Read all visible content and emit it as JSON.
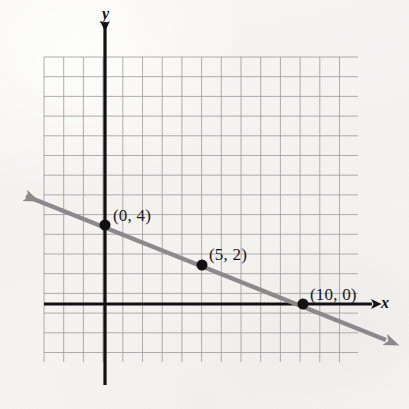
{
  "figure": {
    "kind": "coordinate-plane-line-graph",
    "width": 409,
    "height": 409,
    "background_color": "#f5f4f2"
  },
  "axes": {
    "x_label": "x",
    "y_label": "y",
    "axis_color": "#111113",
    "origin_px": {
      "x": 105,
      "y": 304
    },
    "unit_px": 19.8,
    "x_axis_px": {
      "start_x": 44,
      "end_x": 372,
      "y": 304
    },
    "y_axis_px": {
      "x": 105,
      "start_y": 22,
      "end_y": 385
    }
  },
  "grid": {
    "visible": true,
    "color": "#9a9a9c",
    "cell_px": 19.7,
    "left_px": 44,
    "top_px": 57,
    "right_px": 358,
    "bottom_px": 362,
    "columns": 16,
    "rows": 15
  },
  "line": {
    "color": "#8a8a8c",
    "width_px": 4.5,
    "double_arrow": true,
    "arrow_start_px": {
      "x": 26,
      "y": 196
    },
    "arrow_end_px": {
      "x": 386,
      "y": 340
    }
  },
  "chart_data": {
    "type": "line",
    "title": "",
    "xlabel": "x",
    "ylabel": "y",
    "grid": true,
    "legend": "none",
    "xlim": [
      -3,
      13
    ],
    "ylim": [
      -3,
      13
    ],
    "series": [
      {
        "name": "line",
        "equation": "y = -0.4x + 4",
        "slope": -0.4,
        "intercept": 4,
        "x": [
          -4,
          14.2
        ],
        "values": [
          5.6,
          -1.68
        ],
        "color": "#8a8a8c",
        "arrows": "both"
      }
    ],
    "points": [
      {
        "label": "(0, 4)",
        "x": 0,
        "y": 4,
        "px": {
          "x": 105,
          "y": 225
        },
        "label_px": {
          "x": 113,
          "y": 206
        }
      },
      {
        "label": "(5, 2)",
        "x": 5,
        "y": 2,
        "px": {
          "x": 202,
          "y": 265
        },
        "label_px": {
          "x": 209,
          "y": 245
        }
      },
      {
        "label": "(10, 0)",
        "x": 10,
        "y": 0,
        "px": {
          "x": 303,
          "y": 304
        },
        "label_px": {
          "x": 310,
          "y": 285
        }
      }
    ],
    "point_color": "#111113",
    "point_radius_px": 5.5
  }
}
